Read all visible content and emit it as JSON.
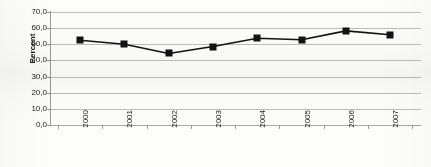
{
  "chart_data": {
    "type": "line",
    "title": "",
    "subtitle": "",
    "xlabel": "",
    "ylabel": "Percent",
    "categories": [
      "2000",
      "2001",
      "2002",
      "2003",
      "2004",
      "2005",
      "2006",
      "2007"
    ],
    "values": [
      52.5,
      50.0,
      44.3,
      48.6,
      53.7,
      52.8,
      58.3,
      55.9
    ],
    "series": [
      {
        "name": "Percent",
        "values": [
          52.5,
          50.0,
          44.3,
          48.6,
          53.7,
          52.8,
          58.3,
          55.9
        ]
      }
    ],
    "ylim": [
      0.0,
      70.0
    ],
    "ytick_step": 10.0,
    "ytick_labels": [
      "70,0",
      "60,0",
      "50,0",
      "40,0",
      "30,0",
      "20,0",
      "10,0",
      "0,0"
    ],
    "ytick_values": [
      70.0,
      60.0,
      50.0,
      40.0,
      30.0,
      20.0,
      10.0,
      0.0
    ],
    "decimal_separator": ",",
    "grid": "horizontal",
    "legend": "none",
    "marker": "square",
    "xlabel_rotation": -90,
    "annotations": []
  },
  "style": {
    "line_color": "#131313",
    "marker_color": "#131313",
    "grid_color": "#bdbdbd",
    "axis_color": "#9a9a9a",
    "text_color": "#1b1b1b",
    "background": "#fdfdfc"
  }
}
